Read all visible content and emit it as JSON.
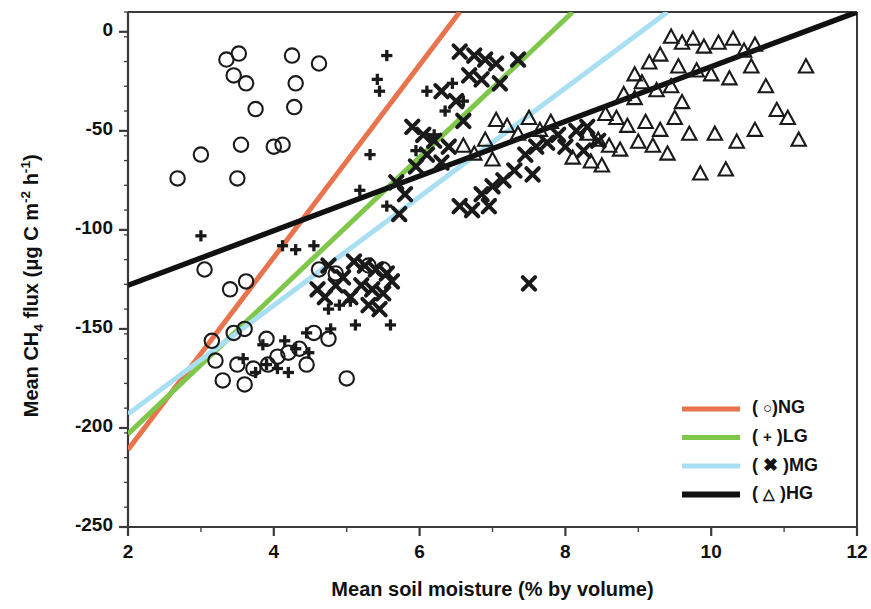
{
  "chart_data": {
    "type": "scatter",
    "title": "",
    "xlabel": "Mean soil moisture (% by volume)",
    "ylabel_parts": {
      "pre": "Mean CH",
      "sub1": "4",
      "mid": " flux (μg C m",
      "sup1": "-2",
      "mid2": " h",
      "sup2": "-1",
      "post": ")"
    },
    "ylabel_plain": "Mean CH4 flux (µg C m-2 h-1)",
    "xlim": [
      2,
      12
    ],
    "ylim": [
      -250,
      10
    ],
    "xticks": [
      2,
      4,
      6,
      8,
      10,
      12
    ],
    "xtick_labels": [
      "2",
      "4",
      "6",
      "8",
      "10",
      "12"
    ],
    "xminor_step": 1,
    "yticks": [
      0,
      -50,
      -100,
      -150,
      -200,
      -250
    ],
    "ytick_labels": [
      "0",
      "-50",
      "-100",
      "-150",
      "-200",
      "-250"
    ],
    "yminor_step": 12.5,
    "grid": false,
    "legend_position": "lower-right",
    "series": [
      {
        "name": "NG",
        "legend_label_pre": "( ",
        "legend_marker": "○",
        "legend_label_post": ")NG",
        "marker": "circle",
        "color": "#E8734C",
        "fit_line": {
          "x1": 2,
          "y1": -211,
          "x2": 6.55,
          "y2": 10
        },
        "points": [
          [
            3.35,
            -14
          ],
          [
            3.45,
            -22
          ],
          [
            3.52,
            -11
          ],
          [
            3.62,
            -26
          ],
          [
            4.25,
            -12
          ],
          [
            4.3,
            -26
          ],
          [
            4.62,
            -16
          ],
          [
            4.28,
            -38
          ],
          [
            3.75,
            -39
          ],
          [
            3.0,
            -62
          ],
          [
            3.55,
            -57
          ],
          [
            4.0,
            -58
          ],
          [
            4.12,
            -57
          ],
          [
            2.68,
            -74
          ],
          [
            3.5,
            -74
          ],
          [
            3.05,
            -120
          ],
          [
            3.4,
            -130
          ],
          [
            3.62,
            -126
          ],
          [
            3.15,
            -156
          ],
          [
            3.45,
            -152
          ],
          [
            3.6,
            -150
          ],
          [
            3.9,
            -155
          ],
          [
            3.2,
            -166
          ],
          [
            3.5,
            -168
          ],
          [
            3.72,
            -170
          ],
          [
            3.92,
            -168
          ],
          [
            4.05,
            -164
          ],
          [
            4.2,
            -162
          ],
          [
            4.35,
            -160
          ],
          [
            4.45,
            -168
          ],
          [
            3.3,
            -176
          ],
          [
            3.6,
            -178
          ],
          [
            5.0,
            -175
          ],
          [
            4.55,
            -152
          ],
          [
            4.75,
            -155
          ],
          [
            4.62,
            -120
          ],
          [
            4.85,
            -122
          ],
          [
            5.3,
            -118
          ],
          [
            5.5,
            -120
          ]
        ]
      },
      {
        "name": "LG",
        "legend_label_pre": "( ",
        "legend_marker": "+",
        "legend_label_post": " )LG",
        "marker": "plus",
        "color": "#7FC74A",
        "fit_line": {
          "x1": 2,
          "y1": -203,
          "x2": 8.1,
          "y2": 10
        },
        "points": [
          [
            5.55,
            -12
          ],
          [
            5.42,
            -24
          ],
          [
            5.45,
            -30
          ],
          [
            5.32,
            -62
          ],
          [
            5.18,
            -80
          ],
          [
            5.55,
            -88
          ],
          [
            3.0,
            -103
          ],
          [
            4.12,
            -108
          ],
          [
            4.3,
            -110
          ],
          [
            4.55,
            -108
          ],
          [
            4.9,
            -138
          ],
          [
            4.75,
            -140
          ],
          [
            5.05,
            -136
          ],
          [
            4.45,
            -152
          ],
          [
            4.78,
            -150
          ],
          [
            5.12,
            -148
          ],
          [
            5.6,
            -148
          ],
          [
            4.15,
            -156
          ],
          [
            4.3,
            -160
          ],
          [
            4.48,
            -162
          ],
          [
            3.9,
            -168
          ],
          [
            4.05,
            -170
          ],
          [
            4.2,
            -172
          ],
          [
            3.75,
            -172
          ],
          [
            3.58,
            -165
          ],
          [
            3.85,
            -158
          ],
          [
            5.95,
            -60
          ],
          [
            6.2,
            -52
          ],
          [
            6.35,
            -40
          ],
          [
            6.1,
            -30
          ],
          [
            6.6,
            -35
          ],
          [
            6.45,
            -26
          ]
        ]
      },
      {
        "name": "MG",
        "legend_label_pre": "( ",
        "legend_marker": "✖",
        "legend_label_post": " )MG",
        "marker": "cross",
        "color": "#A9DFF2",
        "fit_line": {
          "x1": 2,
          "y1": -193,
          "x2": 9.4,
          "y2": 10
        },
        "points": [
          [
            6.55,
            -10
          ],
          [
            6.75,
            -12
          ],
          [
            6.9,
            -14
          ],
          [
            7.05,
            -16
          ],
          [
            6.68,
            -22
          ],
          [
            6.85,
            -24
          ],
          [
            7.1,
            -26
          ],
          [
            7.35,
            -14
          ],
          [
            6.3,
            -30
          ],
          [
            6.5,
            -35
          ],
          [
            6.6,
            -45
          ],
          [
            5.9,
            -48
          ],
          [
            6.05,
            -52
          ],
          [
            6.2,
            -55
          ],
          [
            6.4,
            -58
          ],
          [
            6.1,
            -62
          ],
          [
            6.3,
            -66
          ],
          [
            5.95,
            -68
          ],
          [
            5.68,
            -76
          ],
          [
            5.8,
            -82
          ],
          [
            5.72,
            -92
          ],
          [
            7.45,
            -62
          ],
          [
            7.6,
            -58
          ],
          [
            7.75,
            -56
          ],
          [
            7.9,
            -52
          ],
          [
            7.55,
            -72
          ],
          [
            7.3,
            -70
          ],
          [
            7.15,
            -75
          ],
          [
            7.0,
            -78
          ],
          [
            6.85,
            -82
          ],
          [
            6.95,
            -88
          ],
          [
            6.72,
            -90
          ],
          [
            6.55,
            -88
          ],
          [
            7.5,
            -127
          ],
          [
            5.1,
            -116
          ],
          [
            5.25,
            -118
          ],
          [
            5.4,
            -120
          ],
          [
            5.55,
            -122
          ],
          [
            5.2,
            -128
          ],
          [
            5.35,
            -130
          ],
          [
            5.5,
            -132
          ],
          [
            5.62,
            -126
          ],
          [
            4.95,
            -124
          ],
          [
            5.05,
            -134
          ],
          [
            5.3,
            -138
          ],
          [
            5.45,
            -140
          ],
          [
            4.75,
            -118
          ],
          [
            4.85,
            -128
          ],
          [
            8.15,
            -50
          ],
          [
            8.3,
            -48
          ],
          [
            8.45,
            -55
          ],
          [
            8.0,
            -58
          ],
          [
            8.25,
            -60
          ],
          [
            4.6,
            -130
          ],
          [
            4.7,
            -134
          ]
        ]
      },
      {
        "name": "HG",
        "legend_label_pre": "( ",
        "legend_marker": "△",
        "legend_label_post": " )HG",
        "marker": "triangle",
        "color": "#111111",
        "fit_line": {
          "x1": 2,
          "y1": -128,
          "x2": 12,
          "y2": 10
        },
        "points": [
          [
            9.45,
            -3
          ],
          [
            9.6,
            -6
          ],
          [
            9.75,
            -4
          ],
          [
            9.9,
            -8
          ],
          [
            10.1,
            -6
          ],
          [
            10.3,
            -4
          ],
          [
            10.45,
            -10
          ],
          [
            10.6,
            -7
          ],
          [
            9.3,
            -12
          ],
          [
            9.15,
            -16
          ],
          [
            9.55,
            -18
          ],
          [
            9.8,
            -20
          ],
          [
            10.0,
            -22
          ],
          [
            10.25,
            -24
          ],
          [
            10.55,
            -18
          ],
          [
            8.95,
            -22
          ],
          [
            9.05,
            -26
          ],
          [
            9.25,
            -30
          ],
          [
            9.45,
            -28
          ],
          [
            8.8,
            -32
          ],
          [
            8.95,
            -34
          ],
          [
            9.6,
            -36
          ],
          [
            11.3,
            -18
          ],
          [
            10.75,
            -28
          ],
          [
            10.9,
            -40
          ],
          [
            8.55,
            -42
          ],
          [
            8.7,
            -44
          ],
          [
            8.85,
            -48
          ],
          [
            9.1,
            -46
          ],
          [
            9.3,
            -50
          ],
          [
            9.5,
            -44
          ],
          [
            8.3,
            -52
          ],
          [
            8.45,
            -55
          ],
          [
            8.6,
            -58
          ],
          [
            8.75,
            -60
          ],
          [
            9.0,
            -56
          ],
          [
            9.2,
            -58
          ],
          [
            9.4,
            -62
          ],
          [
            9.7,
            -52
          ],
          [
            10.05,
            -52
          ],
          [
            10.35,
            -56
          ],
          [
            10.6,
            -50
          ],
          [
            7.05,
            -45
          ],
          [
            7.2,
            -48
          ],
          [
            7.35,
            -52
          ],
          [
            6.9,
            -55
          ],
          [
            7.5,
            -44
          ],
          [
            7.65,
            -50
          ],
          [
            7.8,
            -46
          ],
          [
            6.6,
            -58
          ],
          [
            6.75,
            -62
          ],
          [
            7.0,
            -65
          ],
          [
            11.05,
            -44
          ],
          [
            11.2,
            -55
          ],
          [
            8.1,
            -64
          ],
          [
            8.35,
            -66
          ],
          [
            8.5,
            -68
          ],
          [
            10.2,
            -70
          ],
          [
            9.85,
            -72
          ]
        ]
      }
    ]
  },
  "axes": {
    "left_px": 128,
    "right_px": 857,
    "top_px": 12,
    "bottom_px": 527
  }
}
